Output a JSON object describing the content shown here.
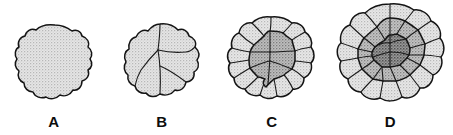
{
  "figure": {
    "background_color": "#ffffff",
    "panel_count": 4,
    "outline_color": "#141414",
    "wall_color": "#1a1a1a",
    "label_color": "#0d0d0d"
  },
  "tones": {
    "light": "#dcdcdc",
    "light_alt": "#d2d2d2",
    "medium": "#b0b0b0",
    "medium_dark": "#a0a0a0",
    "dark": "#8a8a8a",
    "darkest": "#7d7d7d"
  },
  "panels": [
    {
      "id": "a",
      "label": "A",
      "stage": "undivided single chamber",
      "chamber_count": 1,
      "zones": 1,
      "fill": "#dcdcdc"
    },
    {
      "id": "b",
      "label": "B",
      "stage": "first subdivision into four chambers",
      "chamber_count": 4,
      "zones": 1,
      "fill": "#dcdcdc"
    },
    {
      "id": "c",
      "label": "C",
      "stage": "darkened inner core with ring of outer chambers",
      "chamber_count": 11,
      "zones": 2,
      "fill": "#dcdcdc",
      "core_fill": "#a8a8a8"
    },
    {
      "id": "d",
      "label": "D",
      "stage": "three concentric zones with many peripheral chambers",
      "chamber_count": 32,
      "zones": 3,
      "fill": "#dcdcdc",
      "middle_fill": "#b0b0b0",
      "core_fill": "#828282"
    }
  ]
}
